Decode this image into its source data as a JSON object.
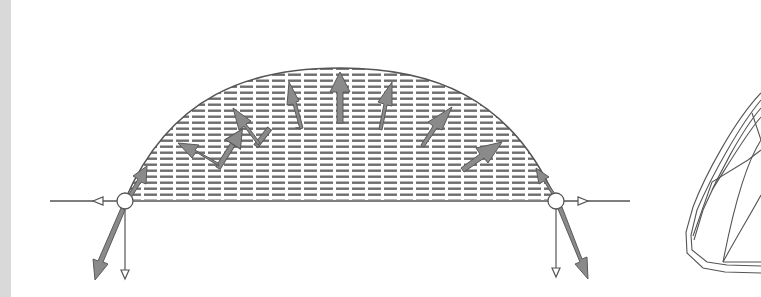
{
  "figure": {
    "colors": {
      "background": "#ffffff",
      "side_strip": "#d9d9d9",
      "line": "#555555",
      "hatch": "#6e6e6e",
      "arrow_fill": "#8a8a8a",
      "arrow_stroke": "#5a5a5a"
    },
    "arch": {
      "left_support_x": 125,
      "right_support_x": 556,
      "baseline_y": 200,
      "crown_y": 68
    },
    "pressure_arrows_count": 10,
    "support_reactions": {
      "left": [
        "horizontal-left",
        "vertical-down",
        "inclined-down-left"
      ],
      "right": [
        "horizontal-right",
        "vertical-down",
        "inclined-down-right"
      ]
    },
    "wireframe_label": "3D shell wireframe (partially visible)"
  }
}
